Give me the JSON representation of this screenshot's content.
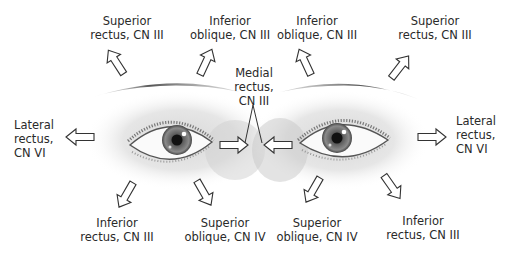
{
  "diagram": {
    "labels": {
      "right_sr": {
        "line1": "Superior",
        "line2": "rectus, CN III"
      },
      "right_io": {
        "line1": "Inferior",
        "line2": "oblique, CN III"
      },
      "left_io": {
        "line1": "Inferior",
        "line2": "oblique, CN III"
      },
      "left_sr": {
        "line1": "Superior",
        "line2": "rectus, CN III"
      },
      "medial": {
        "line1": "Medial",
        "line2": "rectus,",
        "line3": "CN III"
      },
      "right_lr": {
        "line1": "Lateral",
        "line2": "rectus,",
        "line3": "CN VI"
      },
      "left_lr": {
        "line1": "Lateral",
        "line2": "rectus,",
        "line3": "CN VI"
      },
      "right_ir": {
        "line1": "Inferior",
        "line2": "rectus, CN III"
      },
      "right_so": {
        "line1": "Superior",
        "line2": "oblique, CN IV"
      },
      "left_so": {
        "line1": "Superior",
        "line2": "oblique, CN IV"
      },
      "left_ir": {
        "line1": "Inferior",
        "line2": "rectus, CN III"
      }
    },
    "colors": {
      "text": "#2a2a2a",
      "arrow_stroke": "#333333",
      "arrow_fill": "#ffffff",
      "iris": "#6f6f6f",
      "pupil": "#111111"
    }
  }
}
